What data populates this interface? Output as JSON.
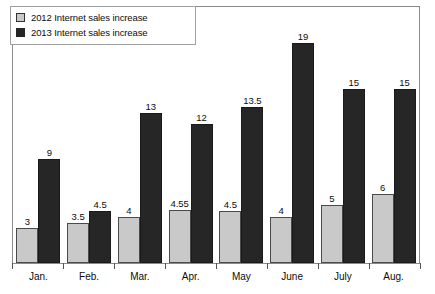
{
  "legend": {
    "position": "top-left",
    "entries": [
      {
        "label": "2012 Internet sales increase",
        "swatch_name": "legend-swatch-2012",
        "color": "#c9c9c9"
      },
      {
        "label": "2013 Internet sales increase",
        "swatch_name": "legend-swatch-2013",
        "color": "#262626"
      }
    ]
  },
  "chart_data": {
    "type": "bar",
    "title": "",
    "subtitle": "",
    "xlabel": "",
    "ylabel": "",
    "grid": false,
    "legend_position": "top-left",
    "ylim": [
      0,
      21
    ],
    "y_axis_visible_ticks": false,
    "categories": [
      "Jan.",
      "Feb.",
      "Mar.",
      "Apr.",
      "May",
      "June",
      "July",
      "Aug."
    ],
    "series": [
      {
        "name": "2012 Internet sales increase",
        "color": "#c9c9c9",
        "values": [
          3,
          3.5,
          4,
          4.55,
          4.5,
          4,
          5,
          6
        ],
        "labels": [
          "3",
          "3.5",
          "4",
          "4.55",
          "4.5",
          "4",
          "5",
          "6"
        ]
      },
      {
        "name": "2013 Internet sales increase",
        "color": "#262626",
        "values": [
          9,
          4.5,
          13,
          12,
          13.5,
          19,
          15,
          15
        ],
        "labels": [
          "9",
          "4.5",
          "13",
          "12",
          "13.5",
          "19",
          "15",
          "15"
        ]
      }
    ]
  }
}
